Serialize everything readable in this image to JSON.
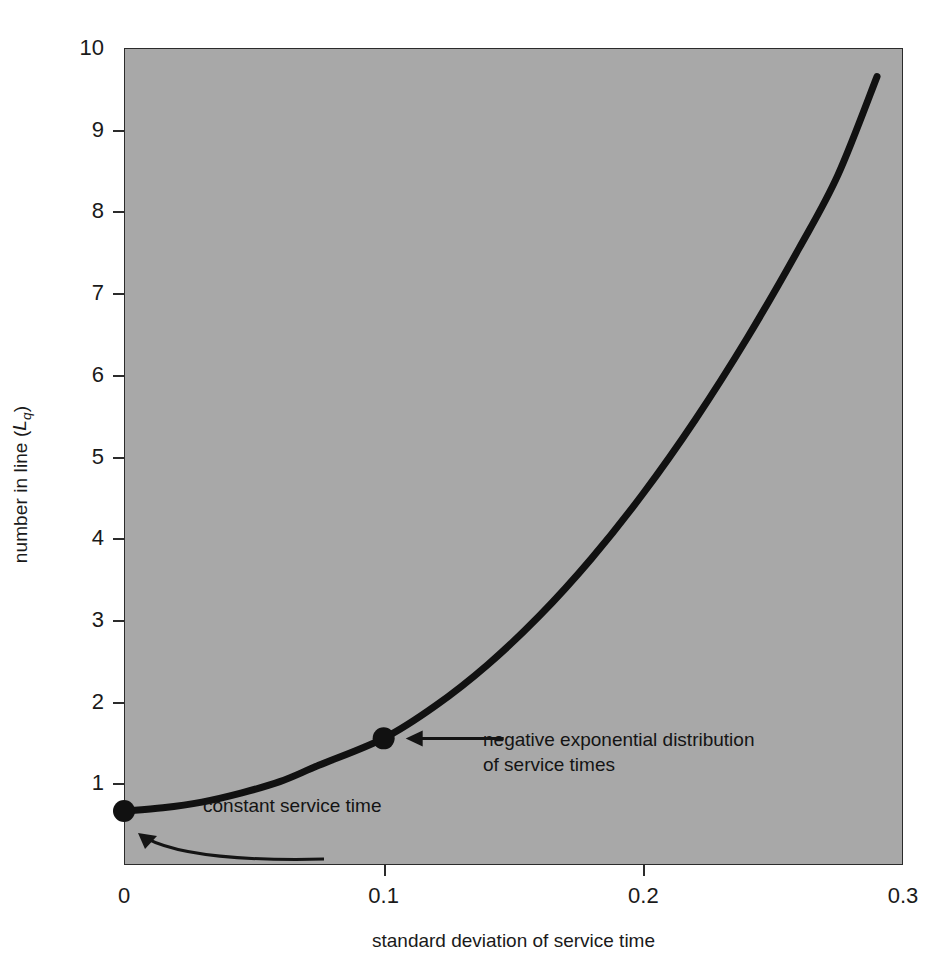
{
  "chart_data": {
    "type": "line",
    "title": "",
    "subtitle": "",
    "xlabel": "standard deviation of service time",
    "ylabel": "number in line (Lq)",
    "ylabel_parts": {
      "text": "number in line (",
      "symbol": "L",
      "subscript": "q",
      "close": ")"
    },
    "xlim": [
      0,
      0.3
    ],
    "ylim": [
      0,
      10
    ],
    "xticks": [
      0,
      0.1,
      0.2,
      0.3
    ],
    "xtick_labels": [
      "0",
      "0.1",
      "0.2",
      "0.3"
    ],
    "yticks": [
      1,
      2,
      3,
      4,
      5,
      6,
      7,
      8,
      9,
      10
    ],
    "ytick_labels": [
      "1",
      "2",
      "3",
      "4",
      "5",
      "6",
      "7",
      "8",
      "9",
      "10"
    ],
    "grid": false,
    "legend": null,
    "plot_background": "#a8a8a8",
    "line_color": "#111111",
    "line_width_px": 7,
    "x": [
      0.0,
      0.015,
      0.03,
      0.045,
      0.06,
      0.075,
      0.1,
      0.12,
      0.14,
      0.16,
      0.18,
      0.2,
      0.22,
      0.24,
      0.26,
      0.275,
      0.29
    ],
    "y": [
      0.66,
      0.7,
      0.77,
      0.88,
      1.02,
      1.22,
      1.55,
      1.95,
      2.45,
      3.05,
      3.75,
      4.55,
      5.45,
      6.45,
      7.55,
      8.45,
      9.65
    ],
    "markers": [
      {
        "name": "constant-service-time",
        "x": 0.0,
        "y": 0.66,
        "style": "filled-circle"
      },
      {
        "name": "negative-exponential",
        "x": 0.1,
        "y": 1.55,
        "style": "filled-circle"
      }
    ],
    "annotations": [
      {
        "id": "negative-exponential",
        "text": "negative exponential distribution\nof service times",
        "arrow": "straight-left",
        "points_to": {
          "x": 0.1,
          "y": 1.55
        }
      },
      {
        "id": "constant-service-time",
        "text": "constant service time",
        "arrow": "curved-up-left",
        "points_to": {
          "x": 0.0,
          "y": 0.66
        }
      }
    ]
  },
  "axes": {
    "y_ticks": [
      {
        "label": "10",
        "value": 10
      },
      {
        "label": "9",
        "value": 9
      },
      {
        "label": "8",
        "value": 8
      },
      {
        "label": "7",
        "value": 7
      },
      {
        "label": "6",
        "value": 6
      },
      {
        "label": "5",
        "value": 5
      },
      {
        "label": "4",
        "value": 4
      },
      {
        "label": "3",
        "value": 3
      },
      {
        "label": "2",
        "value": 2
      },
      {
        "label": "1",
        "value": 1
      }
    ],
    "x_ticks": [
      {
        "label": "0",
        "value": 0
      },
      {
        "label": "0.1",
        "value": 0.1
      },
      {
        "label": "0.2",
        "value": 0.2
      },
      {
        "label": "0.3",
        "value": 0.3
      }
    ]
  }
}
